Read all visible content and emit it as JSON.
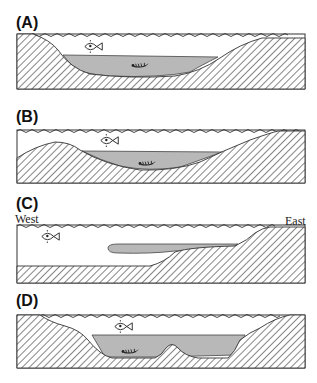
{
  "figure": {
    "panels": [
      {
        "id": "A",
        "label": "(A)",
        "description": "Basin with steep west slope, gentle east slope; deep hypoxic/shaded bottom water with benthic invertebrate; fish in oxic surface water"
      },
      {
        "id": "B",
        "label": "(B)",
        "description": "Shallow sill on west side; basin filled with shaded bottom water with benthic invertebrate; fish above"
      },
      {
        "id": "C",
        "label": "(C)",
        "description": "Shelf sloping up to the east; tongue of shaded water intruding from the east along slope; fish in open water",
        "west_label": "West",
        "east_label": "East"
      },
      {
        "id": "D",
        "label": "(D)",
        "description": "Basin with central mound; shaded bottom water with benthic invertebrate; fish above"
      }
    ],
    "icons": {
      "fish": "fish-icon",
      "invertebrate": "benthic-invertebrate-icon",
      "water_surface": "wavy-water-surface",
      "sediment": "hatched-seabed"
    },
    "colors": {
      "outline": "#333333",
      "hatch": "#444444",
      "shaded_water": "#b8b8b8",
      "background": "#ffffff"
    }
  }
}
